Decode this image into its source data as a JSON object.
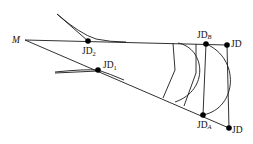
{
  "diagram": {
    "type": "road-alignment-intersection",
    "colors": {
      "line": "#1a1a1a",
      "point": "#000000",
      "background": "#ffffff"
    },
    "labels": {
      "origin": "M",
      "jd2_main": "JD",
      "jd2_sub": "2",
      "jd1_main": "JD",
      "jd1_sub": "1",
      "jdb_main": "JD",
      "jdb_sub": "B",
      "jd_top": "JD",
      "jda_main": "JD",
      "jda_sub": "A",
      "jd_bottom": "JD"
    },
    "points": [
      {
        "id": "M",
        "x": 25,
        "y": 40
      },
      {
        "id": "JD2",
        "x": 88,
        "y": 41
      },
      {
        "id": "JD1",
        "x": 98,
        "y": 70
      },
      {
        "id": "JDB",
        "x": 206,
        "y": 44
      },
      {
        "id": "JD_top",
        "x": 227,
        "y": 45
      },
      {
        "id": "JDA",
        "x": 203,
        "y": 115
      },
      {
        "id": "JD_bottom",
        "x": 229,
        "y": 128
      }
    ]
  }
}
